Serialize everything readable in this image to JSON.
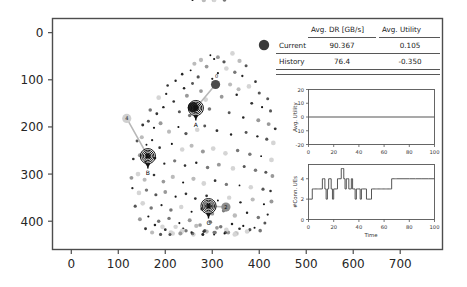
{
  "figure": {
    "background": "#ffffff",
    "frame_color": "#4d4d4d"
  },
  "main_axes": {
    "x_ticks": [
      "0",
      "100",
      "200",
      "300",
      "400",
      "500",
      "600",
      "700"
    ],
    "y_ticks": [
      "0",
      "100",
      "200",
      "300",
      "400"
    ],
    "x_range": [
      -40,
      790
    ],
    "y_range": [
      -30,
      460
    ]
  },
  "table": {
    "legend_marker": "current-dot",
    "legend_marker_color": "#3b3b3b",
    "columns": [
      "",
      "Avg. DR [GB/s]",
      "Avg. Utility"
    ],
    "rows": [
      {
        "label": "Current",
        "dr": "90.367",
        "utility": "0.105"
      },
      {
        "label": "History",
        "dr": "76.4",
        "utility": "-0.350"
      }
    ]
  },
  "base_stations": [
    {
      "id": "A",
      "x": 265,
      "y": 160
    },
    {
      "id": "B",
      "x": 163,
      "y": 262
    },
    {
      "id": "C",
      "x": 292,
      "y": 368
    }
  ],
  "ues": [
    {
      "id": "0",
      "x": 307,
      "y": 110,
      "color": "#4a4a4a",
      "connected_to": "A",
      "label_side": "top"
    },
    {
      "id": "4",
      "x": 118,
      "y": 182,
      "color": "#d0d0d0",
      "connected_to": "B",
      "label_side": "center"
    },
    {
      "id": "2",
      "x": 329,
      "y": 370,
      "color": "#8c8c8c",
      "connected_to": "C",
      "label_side": "center"
    },
    {
      "id": "current",
      "x": 259,
      "y": 158,
      "color": "#2b2b2b",
      "connected_to": "A",
      "label_side": "none"
    }
  ],
  "chart_data": [
    {
      "type": "scatter",
      "title": "",
      "xlabel": "",
      "ylabel": "",
      "xlim": [
        -40,
        790
      ],
      "ylim": [
        460,
        -30
      ],
      "grid": false,
      "legend": "none",
      "description": "Cell map: base stations with concentric coverage rings, connected user equipment, and scattered grayscale signal-strength samples",
      "x": [
        296,
        312,
        343,
        358,
        372,
        262,
        276,
        288,
        304,
        325,
        236,
        254,
        270,
        312,
        330,
        348,
        364,
        392,
        205,
        222,
        240,
        258,
        276,
        300,
        338,
        356,
        378,
        400,
        418,
        186,
        202,
        218,
        246,
        286,
        320,
        352,
        384,
        406,
        424,
        168,
        182,
        196,
        230,
        252,
        294,
        336,
        366,
        398,
        420,
        434,
        152,
        164,
        176,
        190,
        208,
        228,
        244,
        268,
        284,
        310,
        340,
        372,
        396,
        416,
        430,
        140,
        150,
        160,
        172,
        188,
        214,
        236,
        256,
        280,
        302,
        328,
        354,
        380,
        404,
        426,
        132,
        146,
        158,
        178,
        198,
        220,
        242,
        266,
        290,
        314,
        344,
        368,
        392,
        414,
        428,
        128,
        142,
        156,
        176,
        196,
        216,
        238,
        260,
        282,
        306,
        330,
        358,
        382,
        408,
        424,
        130,
        144,
        160,
        180,
        200,
        222,
        244,
        264,
        288,
        312,
        336,
        360,
        386,
        410,
        426,
        136,
        152,
        170,
        192,
        212,
        234,
        256,
        278,
        300,
        324,
        348,
        374,
        398,
        418,
        146,
        164,
        186,
        208,
        230,
        252,
        274,
        296,
        318,
        342,
        366,
        390,
        412,
        158,
        178,
        200,
        222,
        244,
        266,
        288,
        310,
        334,
        358,
        380,
        402,
        172,
        194,
        216,
        238,
        260,
        284,
        306,
        330,
        352,
        376,
        190,
        212,
        236,
        258,
        282,
        304,
        328,
        350,
        374,
        210,
        234,
        258,
        280,
        304,
        326,
        348,
        232,
        256,
        280,
        302,
        326,
        258,
        282,
        304
      ],
      "y": [
        48,
        52,
        44,
        60,
        70,
        66,
        58,
        72,
        56,
        62,
        88,
        80,
        94,
        86,
        76,
        84,
        92,
        104,
        112,
        102,
        118,
        108,
        124,
        98,
        110,
        120,
        114,
        128,
        140,
        138,
        130,
        146,
        134,
        142,
        136,
        132,
        150,
        158,
        166,
        164,
        172,
        158,
        168,
        176,
        162,
        170,
        180,
        186,
        194,
        204,
        196,
        188,
        202,
        192,
        210,
        200,
        214,
        206,
        198,
        208,
        216,
        212,
        220,
        226,
        234,
        230,
        222,
        238,
        228,
        244,
        236,
        248,
        240,
        252,
        246,
        256,
        250,
        258,
        262,
        270,
        268,
        260,
        274,
        266,
        278,
        272,
        282,
        276,
        286,
        280,
        288,
        284,
        292,
        296,
        304,
        308,
        300,
        312,
        302,
        316,
        306,
        318,
        310,
        320,
        314,
        322,
        324,
        328,
        332,
        336,
        330,
        340,
        334,
        344,
        338,
        348,
        342,
        352,
        346,
        356,
        350,
        360,
        354,
        364,
        358,
        368,
        362,
        372,
        366,
        376,
        370,
        380,
        374,
        384,
        378,
        388,
        382,
        392,
        386,
        396,
        390,
        400,
        394,
        404,
        398,
        408,
        402,
        412,
        406,
        410,
        414,
        404,
        416,
        408,
        418,
        412,
        420,
        410,
        422,
        414,
        424,
        416,
        418,
        420,
        424,
        412,
        426,
        416,
        428,
        420,
        424,
        418,
        426,
        422,
        428,
        424,
        420,
        426,
        422,
        428,
        424,
        426,
        422,
        428,
        424,
        426,
        428,
        424,
        426,
        428,
        426,
        424,
        428
      ]
    },
    {
      "type": "line",
      "title": "",
      "xlabel": "",
      "ylabel": "Avg. Utility",
      "x_ticks": [
        "0",
        "20",
        "40",
        "60",
        "80",
        "100"
      ],
      "y_ticks": [
        "-20",
        "-10",
        "0",
        "10",
        "20"
      ],
      "xlim": [
        0,
        100
      ],
      "ylim": [
        -20,
        20
      ],
      "grid": false,
      "legend": "none",
      "line_color": "#555555",
      "x": [
        0,
        5,
        10,
        15,
        20,
        25,
        30,
        35,
        40,
        45,
        50,
        55,
        60,
        65,
        70,
        75,
        80,
        85,
        90,
        95,
        100
      ],
      "values": [
        0,
        0,
        0,
        0,
        0,
        0,
        0,
        0,
        0,
        0,
        0,
        0,
        0,
        0,
        0,
        0,
        0,
        0,
        0,
        0,
        0
      ]
    },
    {
      "type": "line",
      "title": "",
      "xlabel": "Time",
      "ylabel": "#Conn. UEs",
      "x_ticks": [
        "0",
        "20",
        "40",
        "60",
        "80",
        "100"
      ],
      "y_ticks": [
        "0",
        "2",
        "4"
      ],
      "xlim": [
        0,
        100
      ],
      "ylim": [
        0,
        5.4
      ],
      "grid": false,
      "legend": "none",
      "line_color": "#555555",
      "x": [
        0,
        1,
        2,
        3,
        4,
        5,
        6,
        7,
        8,
        9,
        10,
        11,
        12,
        13,
        14,
        15,
        16,
        17,
        18,
        19,
        20,
        21,
        22,
        23,
        24,
        25,
        26,
        27,
        28,
        29,
        30,
        31,
        32,
        33,
        34,
        35,
        36,
        37,
        38,
        39,
        40,
        41,
        42,
        43,
        44,
        45,
        46,
        47,
        48,
        49,
        50,
        51,
        52,
        53,
        54,
        55,
        56,
        57,
        58,
        59,
        60,
        61,
        62,
        63,
        64,
        65,
        66,
        67,
        68,
        69,
        70,
        75,
        80,
        85,
        90,
        95,
        100
      ],
      "values": [
        2,
        2,
        2,
        3,
        3,
        3,
        3,
        3,
        3,
        3,
        3,
        4,
        4,
        3,
        2,
        3,
        4,
        4,
        3,
        2,
        3,
        3,
        3,
        4,
        4,
        4,
        5,
        5,
        4,
        3,
        4,
        4,
        3,
        3,
        4,
        3,
        3,
        2,
        3,
        3,
        3,
        2,
        3,
        3,
        3,
        3,
        2,
        2,
        2,
        2,
        3,
        3,
        3,
        3,
        3,
        3,
        3,
        3,
        3,
        3,
        3,
        3,
        3,
        3,
        3,
        3,
        4,
        4,
        4,
        4,
        4,
        4,
        4,
        4,
        4,
        4,
        4
      ]
    }
  ]
}
